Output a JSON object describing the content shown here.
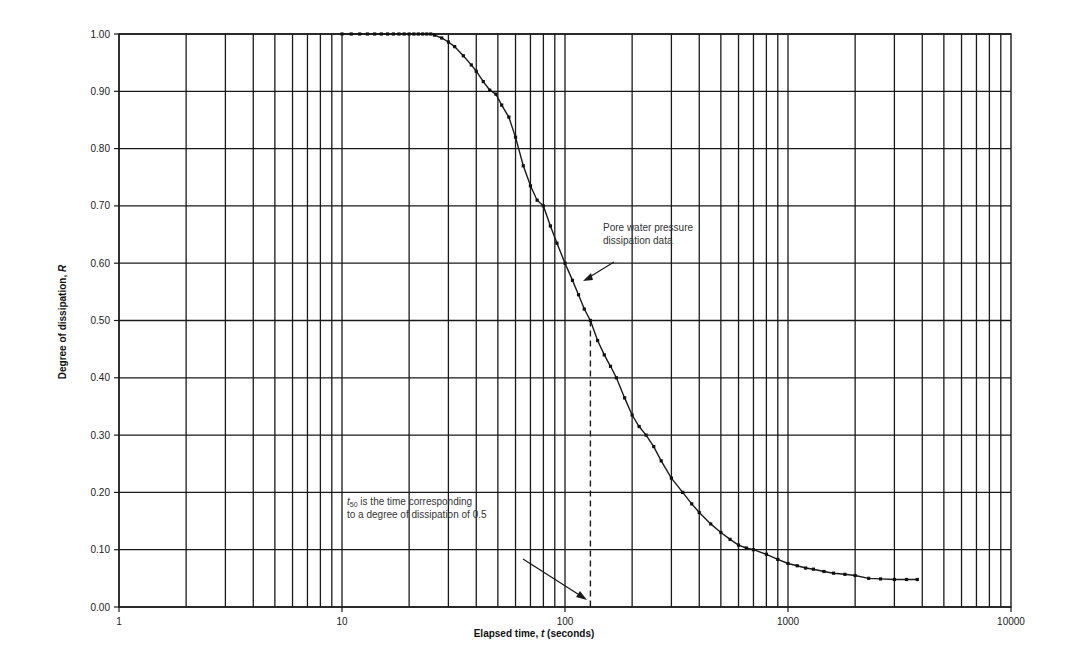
{
  "chart_data": {
    "type": "scatter",
    "title": "",
    "xlabel": "Elapsed time, t (seconds)",
    "ylabel": "Degree of dissipation, R",
    "xscale": "log",
    "xlim": [
      1,
      10000
    ],
    "ylim": [
      0.0,
      1.0
    ],
    "x_ticks": [
      1,
      10,
      100,
      1000,
      10000
    ],
    "x_tick_labels": [
      "1",
      "10",
      "100",
      "1000",
      "10000"
    ],
    "y_ticks": [
      0.0,
      0.1,
      0.2,
      0.3,
      0.4,
      0.5,
      0.6,
      0.7,
      0.8,
      0.9,
      1.0
    ],
    "y_tick_labels": [
      "0.00",
      "0.10",
      "0.20",
      "0.30",
      "0.40",
      "0.50",
      "0.60",
      "0.70",
      "0.80",
      "0.90",
      "1.00"
    ],
    "grid": true,
    "legend": null,
    "series": [
      {
        "name": "Pore water pressure dissipation data",
        "x": [
          10,
          11,
          12,
          13,
          14,
          15,
          16,
          17,
          18,
          19,
          20,
          21,
          22,
          23,
          24,
          25,
          26,
          28,
          30,
          32,
          35,
          38,
          40,
          43,
          46,
          49,
          52,
          56,
          60,
          65,
          70,
          75,
          80,
          86,
          92,
          100,
          108,
          115,
          122,
          130,
          140,
          150,
          160,
          170,
          185,
          200,
          215,
          231,
          250,
          270,
          300,
          337,
          370,
          400,
          450,
          500,
          550,
          600,
          650,
          700,
          800,
          900,
          1000,
          1100,
          1200,
          1300,
          1450,
          1600,
          1800,
          2000,
          2300,
          2600,
          3000,
          3400,
          3800
        ],
        "y": [
          1.0,
          1.0,
          1.0,
          1.0,
          1.0,
          1.0,
          1.0,
          1.0,
          1.0,
          1.0,
          1.0,
          1.0,
          1.0,
          1.0,
          1.0,
          1.0,
          0.998,
          0.993,
          0.986,
          0.978,
          0.962,
          0.946,
          0.935,
          0.917,
          0.902,
          0.895,
          0.876,
          0.855,
          0.82,
          0.77,
          0.735,
          0.71,
          0.7,
          0.665,
          0.635,
          0.6,
          0.57,
          0.545,
          0.52,
          0.5,
          0.465,
          0.44,
          0.42,
          0.4,
          0.365,
          0.335,
          0.315,
          0.3,
          0.28,
          0.255,
          0.225,
          0.2,
          0.18,
          0.165,
          0.145,
          0.13,
          0.118,
          0.108,
          0.103,
          0.1,
          0.092,
          0.083,
          0.076,
          0.072,
          0.068,
          0.066,
          0.062,
          0.059,
          0.057,
          0.055,
          0.05,
          0.049,
          0.048,
          0.048,
          0.048
        ]
      }
    ],
    "annotations": [
      {
        "text": "Pore water pressure dissipation data",
        "points_to": {
          "x": 105,
          "y": 0.58
        }
      },
      {
        "text": "t50 is the time corresponding to a degree of dissipation of 0.5",
        "points_to": {
          "x": 130,
          "y": 0.0
        }
      },
      {
        "type": "dashed_vertical_line",
        "x": 130,
        "y_from": 0.0,
        "y_to": 0.5,
        "label": "t50"
      }
    ]
  },
  "labels": {
    "xlabel_main": "Elapsed time, ",
    "xlabel_var": "t",
    "xlabel_unit": " (seconds)",
    "ylabel_main": "Degree of dissipation, ",
    "ylabel_var": "R",
    "annot1_line1": "Pore water pressure",
    "annot1_line2": "dissipation data",
    "annot2_sub_t": "t",
    "annot2_sub": "50",
    "annot2_line1_rest": " is the time corresponding",
    "annot2_line2": "to a degree of dissipation of 0.5"
  }
}
